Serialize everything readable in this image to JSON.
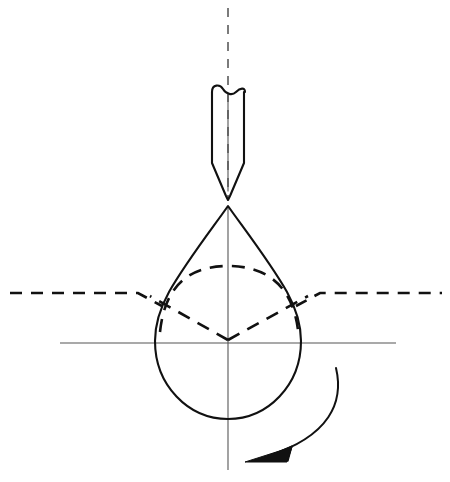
{
  "canvas": {
    "width": 450,
    "height": 482,
    "background": "#ffffff",
    "ink": "#111111"
  },
  "figure": {
    "type": "engineering-line-drawing",
    "title": "",
    "caption": ""
  },
  "style": {
    "solid_stroke": "#111111",
    "solid_width": 2.0,
    "thin_stroke": "#444444",
    "thin_width": 1.0,
    "hidden_stroke": "#111111",
    "hidden_width": 2.6,
    "hidden_dash": "12 9",
    "axis_dash": "9 8",
    "arrow_stroke": "#111111",
    "arrow_width": 2.0
  },
  "elements": {
    "vertical_axis": {
      "label": "vertical-axis-centerline",
      "kind": "dashed-center-line",
      "x": 228,
      "y_top": 8,
      "y_bottom": 470
    },
    "horizontal_axis": {
      "label": "horizontal-center-line",
      "kind": "thin-solid-line",
      "y": 343,
      "x_left": 60,
      "x_right": 396
    },
    "surface_line": {
      "label": "surface-reference-line",
      "kind": "dashed-line-with-dip",
      "y_outer": 294,
      "x_left": 10,
      "x_right": 442,
      "dip_left_x": 145,
      "dip_right_x": 312
    },
    "tool": {
      "label": "tool-shank",
      "left_x": 211,
      "right_x": 245,
      "top_y": 88,
      "taper_start_y": 162,
      "tip_y": 197,
      "tip_x": 228,
      "break_line": "double-arc-break-symbol",
      "inner_line_x": 228
    },
    "drop": {
      "label": "pear-shaped-droplet",
      "apex_x": 228,
      "apex_y": 205,
      "left_x": 155,
      "right_x": 301,
      "bottom_y": 419,
      "widest_y": 338
    },
    "hidden_arc": {
      "label": "hidden-upper-ellipse-arc",
      "left_x": 160,
      "right_x": 298,
      "crest_y": 267,
      "end_y": 330
    },
    "hidden_vee": {
      "label": "hidden-vee-construction-lines",
      "apex_x": 228,
      "apex_y": 338,
      "left_end_x": 145,
      "right_end_x": 312,
      "end_y": 295
    },
    "rotation_arrow": {
      "label": "rotation-direction-arrow",
      "start_x": 336,
      "start_y": 368,
      "end_x": 246,
      "end_y": 458,
      "direction": "counter-clockwise-downward-left",
      "arrowhead": "solid-filled-triangle"
    }
  },
  "annotations": {
    "items": []
  }
}
